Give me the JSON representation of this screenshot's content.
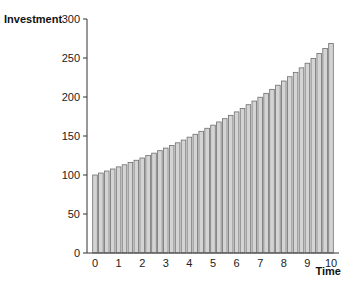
{
  "chart_data": {
    "type": "bar",
    "title": "",
    "xlabel": "Time",
    "ylabel": "Investment",
    "ylim": [
      0,
      300
    ],
    "xlim": [
      0,
      10
    ],
    "yticks": [
      0,
      50,
      100,
      150,
      200,
      250,
      300
    ],
    "xticks": [
      0,
      1,
      2,
      3,
      4,
      5,
      6,
      7,
      8,
      9,
      10
    ],
    "grid": false,
    "legend": null,
    "bar_color": "#d4d4d4",
    "bar_edge_color": "#6e6e6e",
    "x": [
      0,
      0.25,
      0.5,
      0.75,
      1,
      1.25,
      1.5,
      1.75,
      2,
      2.25,
      2.5,
      2.75,
      3,
      3.25,
      3.5,
      3.75,
      4,
      4.25,
      4.5,
      4.75,
      5,
      5.25,
      5.5,
      5.75,
      6,
      6.25,
      6.5,
      6.75,
      7,
      7.25,
      7.5,
      7.75,
      8,
      8.25,
      8.5,
      8.75,
      9,
      9.25,
      9.5,
      9.75,
      10
    ],
    "values": [
      100.0,
      102.5,
      105.1,
      107.7,
      110.4,
      113.1,
      116.0,
      118.9,
      121.8,
      124.9,
      128.0,
      131.2,
      134.5,
      137.9,
      141.3,
      144.8,
      148.5,
      152.2,
      156.0,
      159.9,
      163.9,
      168.0,
      172.2,
      176.5,
      180.9,
      185.4,
      190.1,
      194.8,
      199.7,
      204.7,
      209.8,
      215.1,
      220.5,
      226.0,
      231.6,
      237.4,
      243.3,
      249.4,
      255.7,
      262.1,
      268.5
    ]
  }
}
